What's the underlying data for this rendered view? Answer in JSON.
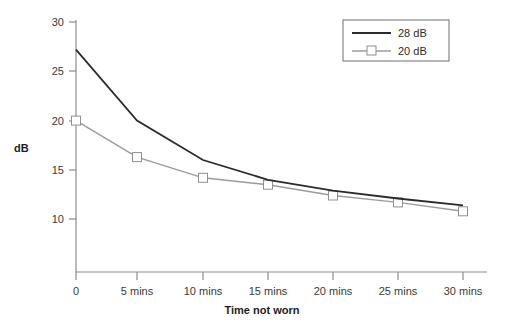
{
  "chart_data": {
    "type": "line",
    "title": "",
    "xlabel": "Time not worn",
    "ylabel": "dB",
    "categories": [
      "0",
      "5 mins",
      "10 mins",
      "15 mins",
      "20 mins",
      "25 mins",
      "30 mins"
    ],
    "x_tick_labels": [
      "0",
      "5 mins",
      "10 mins",
      "15 mins",
      "20 mins",
      "25 mins",
      "30 mins"
    ],
    "y_tick_labels": [
      "30",
      "25",
      "20",
      "15",
      "10"
    ],
    "y_ticks": [
      30,
      25,
      20,
      15,
      10
    ],
    "ylim": [
      5,
      30
    ],
    "grid": false,
    "legend_position": "top-right",
    "series": [
      {
        "name": "28 dB",
        "color": "#2b2b2b",
        "marker": "none",
        "values": [
          27.2,
          20.0,
          16.0,
          14.0,
          12.9,
          12.1,
          11.4
        ]
      },
      {
        "name": "20 dB",
        "color": "#9b9b9b",
        "marker": "open-square",
        "values": [
          20.0,
          16.3,
          14.2,
          13.5,
          12.4,
          11.7,
          10.8
        ]
      }
    ]
  },
  "axes": {
    "y_title": "dB",
    "x_title": "Time not worn"
  },
  "legend": {
    "entries": [
      {
        "label": "28 dB"
      },
      {
        "label": "20 dB"
      }
    ]
  },
  "colors": {
    "series_28db": "#2b2b2b",
    "series_20db": "#9b9b9b",
    "axis": "#8c8c8c",
    "text": "#2b2b2b",
    "background": "#ffffff"
  }
}
